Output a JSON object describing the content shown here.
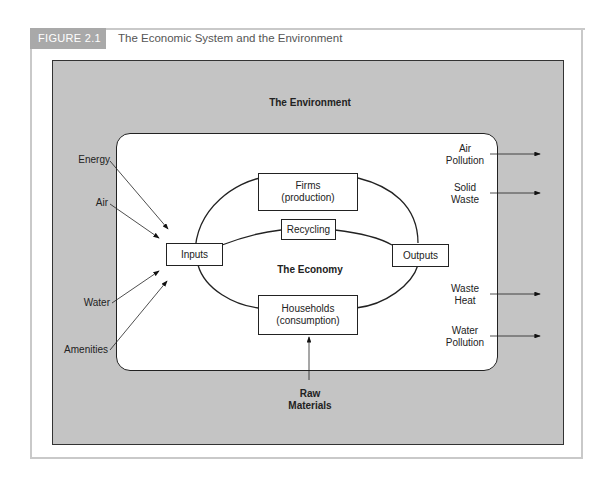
{
  "figure": {
    "tag": "FIGURE 2.1",
    "title": "The Economic System and the Environment"
  },
  "diagram": {
    "environment_label": "The Environment",
    "economy_label": "The Economy",
    "nodes": {
      "firms": [
        "Firms",
        "(production)"
      ],
      "households": [
        "Households",
        "(consumption)"
      ],
      "recycling": "Recycling",
      "inputs": "Inputs",
      "outputs": "Outputs"
    },
    "inflows": [
      "Energy",
      "Air",
      "Water",
      "Amenities"
    ],
    "outflows": [
      [
        "Air",
        "Pollution"
      ],
      [
        "Solid",
        "Waste"
      ],
      [
        "Waste",
        "Heat"
      ],
      [
        "Water",
        "Pollution"
      ]
    ],
    "raw_materials": [
      "Raw",
      "Materials"
    ]
  }
}
